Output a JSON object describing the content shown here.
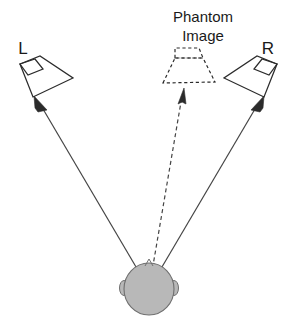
{
  "diagram": {
    "canvas": {
      "width": 297,
      "height": 321,
      "background": "#ffffff"
    },
    "colors": {
      "line": "#2b2b2b",
      "ray": "#444444",
      "head_fill": "#b8b8b8",
      "head_stroke": "#6f6f6f",
      "text": "#1a1a1a",
      "background": "#ffffff"
    },
    "labels": {
      "left_speaker": "L",
      "right_speaker": "R",
      "phantom_line1": "Phantom",
      "phantom_line2": "Image"
    },
    "elements": {
      "left_speaker": {
        "name": "left-speaker",
        "style": "solid",
        "label": "L",
        "label_position": {
          "x": 23,
          "y": 54
        },
        "horn_points": "20,64 40,56 73,78 33,97",
        "magnet_points": "20,64 35,59 43,69 28,75"
      },
      "right_speaker": {
        "name": "right-speaker",
        "style": "solid",
        "label": "R",
        "label_position": {
          "x": 268,
          "y": 54
        },
        "horn_points": "277,64 257,56 224,78 264,97",
        "magnet_points": "277,64 262,59 254,69 269,75"
      },
      "phantom_speaker": {
        "name": "phantom-speaker",
        "style": "dashed",
        "horn_points": "163,83 175,58 203,58 215,82",
        "magnet_points": "175,58 175,48 199,48 203,58"
      },
      "listener_head": {
        "name": "listener-head",
        "center": {
          "x": 149,
          "y": 289
        },
        "rx": 25,
        "ry": 26,
        "fill": "#b8b8b8",
        "left_ear": {
          "cx": 124,
          "cy": 288,
          "rx": 4,
          "ry": 7
        },
        "right_ear": {
          "cx": 174,
          "cy": 288,
          "rx": 4,
          "ry": 7
        },
        "nose": "145,266 149,260 153,266"
      }
    },
    "rays": [
      {
        "name": "ray-to-left-speaker",
        "style": "solid",
        "from": {
          "x": 149,
          "y": 289
        },
        "to": {
          "x": 37,
          "y": 99
        },
        "arrow": "head-at-end",
        "description": "Sound path from listener to left speaker"
      },
      {
        "name": "ray-to-right-speaker",
        "style": "solid",
        "from": {
          "x": 149,
          "y": 289
        },
        "to": {
          "x": 261,
          "y": 99
        },
        "arrow": "head-at-end",
        "description": "Sound path from listener to right speaker"
      },
      {
        "name": "ray-to-phantom-image",
        "style": "dashed",
        "from": {
          "x": 149,
          "y": 289
        },
        "to": {
          "x": 184,
          "y": 90
        },
        "arrow": "head-at-end",
        "description": "Perceived direction of the phantom image"
      }
    ]
  }
}
